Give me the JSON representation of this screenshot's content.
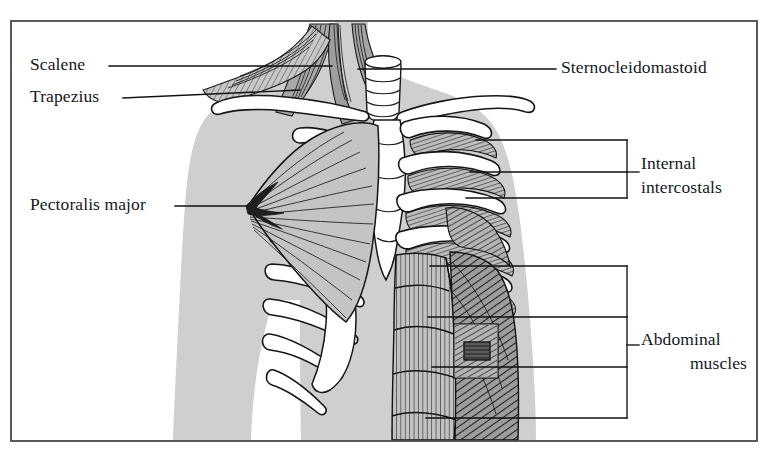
{
  "figure": {
    "frame": {
      "border_color": "#4a4a4a",
      "background": "#ffffff"
    },
    "palette": {
      "body_silhouette": "#cfcfcf",
      "muscle_fill": "#b9b9b9",
      "bone_white": "#ffffff",
      "ink": "#1a1a1a",
      "leader_line": "#111111"
    },
    "labels": [
      {
        "id": "scalene",
        "text": "Scalene",
        "side": "left",
        "x": 30,
        "y": 56,
        "leader": {
          "from": [
            109,
            66
          ],
          "to": [
            330,
            66
          ]
        }
      },
      {
        "id": "trapezius",
        "text": "Trapezius",
        "side": "left",
        "x": 30,
        "y": 88,
        "leader": {
          "from": [
            123,
            98
          ],
          "to": [
            300,
            90
          ]
        }
      },
      {
        "id": "pectoralis-major",
        "text": "Pectoralis major",
        "side": "left",
        "x": 30,
        "y": 196,
        "leader": {
          "from": [
            175,
            206
          ],
          "to": [
            247,
            206
          ]
        }
      },
      {
        "id": "sternocleidomastoid",
        "text": "Sternocleidomastoid",
        "side": "right",
        "x": 561,
        "y": 59,
        "leader": {
          "from": [
            556,
            69
          ],
          "to": [
            360,
            69
          ]
        }
      },
      {
        "id": "internal-intercostals",
        "text": "Internal\nintercostals",
        "line1": "Internal",
        "line2": "intercostals",
        "side": "right",
        "x": 641,
        "y": 155,
        "bracket": {
          "spine_x": 627,
          "top": 140,
          "bottom": 198,
          "stub_y": 170,
          "stub_x2": 639,
          "leaders_y": [
            140,
            172,
            198
          ],
          "leader_x_left": [
            476,
            470,
            466
          ]
        }
      },
      {
        "id": "abdominal-muscles",
        "text": "Abdominal\nmuscles",
        "line1": "Abdominal",
        "line2": "muscles",
        "side": "right",
        "x": 641,
        "y": 331,
        "bracket": {
          "spine_x": 627,
          "top": 266,
          "bottom": 420,
          "stub_y": 345,
          "stub_x2": 639,
          "leaders_y": [
            266,
            317,
            367,
            418
          ],
          "leader_x_left": [
            430,
            428,
            432,
            426
          ]
        }
      }
    ],
    "anatomy_parts": [
      "body-silhouette",
      "trachea",
      "left-clavicle",
      "right-clavicle",
      "sternum",
      "ribs",
      "costal-cartilage",
      "pectoralis-major-fan",
      "scalene-muscles",
      "trapezius-muscle",
      "sternocleidomastoid-muscle",
      "internal-intercostal-hatching",
      "rectus-abdominis",
      "external-oblique",
      "abdominal-inset-detail"
    ]
  }
}
